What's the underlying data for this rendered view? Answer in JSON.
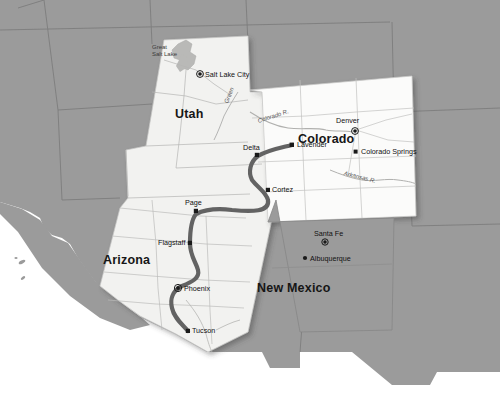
{
  "map": {
    "title": "Southwestern United States route map",
    "colors": {
      "base_land": "#9b9b9b",
      "highlight_land": "#f3f3f1",
      "highlight_land_shadow": "#d9d9d7",
      "water": "#ffffff",
      "route": "#5f5f5f",
      "boundary": "#8c8c8c",
      "river": "#b0b0b0",
      "marker": "#1a1a1a",
      "label": "#1a1a1a"
    },
    "states": [
      {
        "name": "Utah",
        "label": "Utah",
        "x": 193,
        "y": 115,
        "highlighted": true
      },
      {
        "name": "Colorado",
        "label": "Colorado",
        "x": 325,
        "y": 140,
        "highlighted": true
      },
      {
        "name": "Arizona",
        "label": "Arizona",
        "x": 130,
        "y": 261,
        "highlighted": true
      },
      {
        "name": "New Mexico",
        "label": "New Mexico",
        "x": 293,
        "y": 289,
        "highlighted": true
      }
    ],
    "cities": [
      {
        "name": "Salt Lake City",
        "label": "Salt Lake City",
        "x": 200,
        "y": 74,
        "type": "capital",
        "label_x": 205,
        "label_y": 71
      },
      {
        "name": "Denver",
        "label": "Denver",
        "x": 355,
        "y": 131,
        "type": "capital",
        "label_x": 338,
        "label_y": 116
      },
      {
        "name": "Colorado Springs",
        "label": "Colorado Springs",
        "x": 356,
        "y": 152,
        "type": "city",
        "label_x": 361,
        "label_y": 148
      },
      {
        "name": "Lavender",
        "label": "Lavender",
        "x": 292,
        "y": 145,
        "type": "city",
        "label_x": 297,
        "label_y": 142
      },
      {
        "name": "Delta",
        "label": "Delta",
        "x": 257,
        "y": 155,
        "type": "city",
        "label_x": 245,
        "label_y": 144
      },
      {
        "name": "Cortez",
        "label": "Cortez",
        "x": 268,
        "y": 190,
        "type": "city",
        "label_x": 273,
        "label_y": 187
      },
      {
        "name": "Page",
        "label": "Page",
        "x": 196,
        "y": 211,
        "type": "city",
        "label_x": 186,
        "label_y": 200
      },
      {
        "name": "Flagstaff",
        "label": "Flagstaff",
        "x": 190,
        "y": 243,
        "type": "city",
        "label_x": 160,
        "label_y": 240
      },
      {
        "name": "Phoenix",
        "label": "Phoenix",
        "x": 178,
        "y": 288,
        "type": "capital",
        "label_x": 185,
        "label_y": 285
      },
      {
        "name": "Tucson",
        "label": "Tucson",
        "x": 188,
        "y": 331,
        "type": "city",
        "label_x": 193,
        "label_y": 328
      },
      {
        "name": "Santa Fe",
        "label": "Santa Fe",
        "x": 325,
        "y": 242,
        "type": "capital",
        "label_x": 316,
        "label_y": 229
      },
      {
        "name": "Albuquerque",
        "label": "Albuquerque",
        "x": 305,
        "y": 258,
        "type": "city",
        "label_x": 310,
        "label_y": 255
      }
    ],
    "water_features": [
      {
        "name": "Great Salt Lake",
        "label_line1": "Great",
        "label_line2": "Salt Lake",
        "x": 159,
        "y": 45
      }
    ],
    "rivers": [
      {
        "name": "Colorado River",
        "label": "Colorado R.",
        "x": 262,
        "y": 124,
        "rotation": -18
      },
      {
        "name": "Green River",
        "label": "Green",
        "x": 228,
        "y": 105,
        "rotation": -68
      },
      {
        "name": "Arkansas River",
        "label": "Arkansas R.",
        "x": 352,
        "y": 175,
        "rotation": 14
      }
    ],
    "route": {
      "name": "highlighted-route",
      "from": "Lavender",
      "through": [
        "Delta",
        "Cortez",
        "Page",
        "Flagstaff",
        "Phoenix"
      ],
      "to": "Tucson",
      "stroke_width": 4.2
    }
  }
}
